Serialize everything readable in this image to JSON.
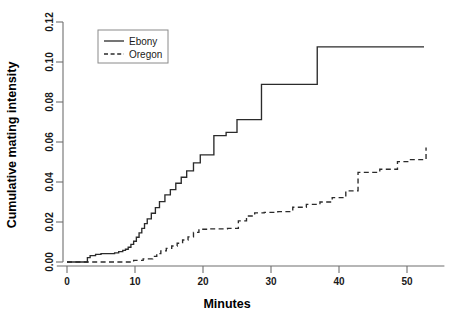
{
  "chart_data": {
    "type": "line",
    "title": "",
    "subtitle": "",
    "xlabel": "Minutes",
    "ylabel": "Cumulative mating intensity",
    "xlim": [
      -1.5,
      55.5
    ],
    "ylim": [
      0.0,
      0.125
    ],
    "xticks": [
      0,
      10,
      20,
      30,
      40,
      50
    ],
    "xtick_labels": [
      "0",
      "10",
      "20",
      "30",
      "40",
      "50"
    ],
    "yticks": [
      0.0,
      0.02,
      0.04,
      0.06,
      0.08,
      0.1,
      0.12
    ],
    "ytick_labels": [
      "0.00",
      "0.02",
      "0.04",
      "0.06",
      "0.08",
      "0.10",
      "0.12"
    ],
    "grid": false,
    "legend_position": "top-left",
    "legend_entries": [
      {
        "name": "Ebony",
        "style": "solid"
      },
      {
        "name": "Oregon",
        "style": "dashed"
      }
    ],
    "series": [
      {
        "name": "Ebony",
        "style": "solid",
        "step": "post",
        "x": [
          0.0,
          2.6,
          3.0,
          3.4,
          4.2,
          5.0,
          7.0,
          7.6,
          8.2,
          8.6,
          9.0,
          9.4,
          9.8,
          10.2,
          10.6,
          11.0,
          11.4,
          11.8,
          12.4,
          13.0,
          13.6,
          14.4,
          15.2,
          16.0,
          16.8,
          17.6,
          18.6,
          19.6,
          21.6,
          23.4,
          25.0,
          28.6,
          36.8,
          52.5
        ],
        "y": [
          0.0,
          0.0,
          0.0022,
          0.0032,
          0.0038,
          0.0042,
          0.0046,
          0.0052,
          0.0058,
          0.0064,
          0.0074,
          0.0088,
          0.0104,
          0.0124,
          0.0146,
          0.0168,
          0.0192,
          0.0216,
          0.0244,
          0.0272,
          0.0302,
          0.0336,
          0.0362,
          0.0394,
          0.0424,
          0.0456,
          0.0496,
          0.0536,
          0.0632,
          0.0648,
          0.0712,
          0.0888,
          0.1076,
          0.1076
        ]
      },
      {
        "name": "Oregon",
        "style": "dashed",
        "step": "post",
        "x": [
          0.0,
          9.2,
          9.8,
          10.6,
          11.2,
          12.0,
          12.6,
          13.2,
          13.8,
          14.6,
          15.4,
          16.2,
          17.0,
          17.8,
          18.6,
          19.4,
          21.0,
          23.6,
          25.2,
          26.4,
          27.6,
          29.0,
          31.0,
          33.2,
          35.2,
          37.2,
          39.0,
          41.0,
          42.8,
          46.0,
          48.6,
          50.4,
          52.8
        ],
        "y": [
          0.0,
          0.0,
          0.0008,
          0.0008,
          0.0016,
          0.0016,
          0.0028,
          0.0042,
          0.0056,
          0.0068,
          0.008,
          0.0094,
          0.011,
          0.0126,
          0.0148,
          0.0164,
          0.0166,
          0.0168,
          0.0206,
          0.023,
          0.0246,
          0.0248,
          0.0252,
          0.0274,
          0.0288,
          0.03,
          0.0322,
          0.0356,
          0.0448,
          0.0464,
          0.0502,
          0.0512,
          0.0572
        ]
      }
    ]
  }
}
